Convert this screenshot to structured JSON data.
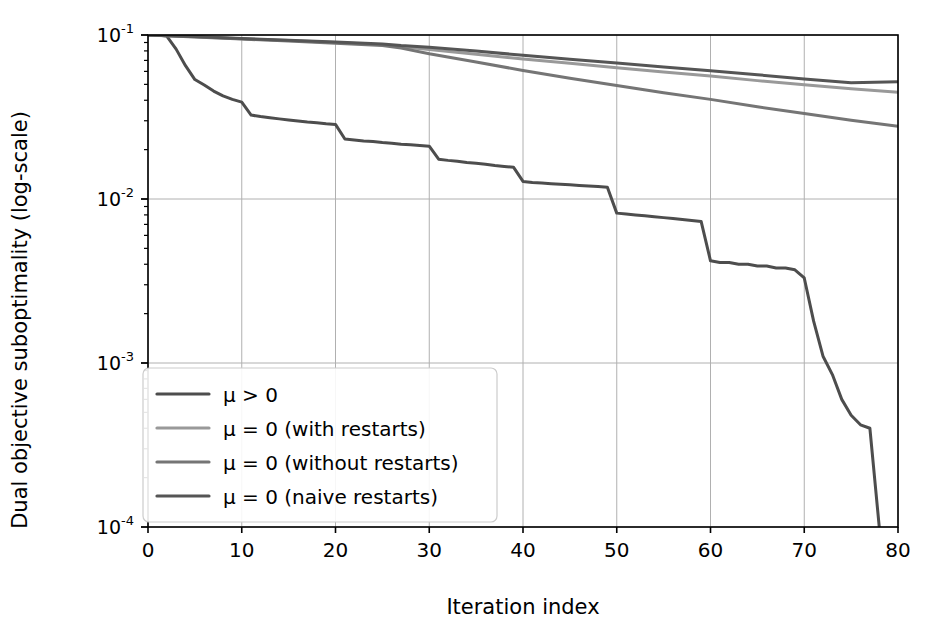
{
  "chart_data": {
    "type": "line",
    "title": "",
    "xlabel": "Iteration index",
    "ylabel": "Dual objective suboptimality (log-scale)",
    "yscale": "log",
    "xlim": [
      0,
      80
    ],
    "ylim": [
      0.0001,
      0.1
    ],
    "grid": true,
    "legend_position": "lower left",
    "xticks": [
      0,
      10,
      20,
      30,
      40,
      50,
      60,
      70,
      80
    ],
    "xticklabels": [
      "0",
      "10",
      "20",
      "30",
      "40",
      "50",
      "60",
      "70",
      "80"
    ],
    "yticks": [
      0.1,
      0.01,
      0.001,
      0.0001
    ],
    "yticklabels": [
      "10-1",
      "10-2",
      "10-3",
      "10-4"
    ],
    "ytick_mantissa": [
      "10",
      "10",
      "10",
      "10"
    ],
    "ytick_exponent": [
      "-1",
      "-2",
      "-3",
      "-4"
    ],
    "series": [
      {
        "name": "mu-greater-zero",
        "label": "μ > 0",
        "color": "#4d4d4d",
        "linewidth": 3.0,
        "x": [
          0,
          1,
          2,
          3,
          4,
          5,
          6,
          7,
          8,
          9,
          10,
          11,
          12,
          13,
          14,
          15,
          16,
          17,
          18,
          19,
          20,
          21,
          22,
          23,
          24,
          25,
          26,
          27,
          28,
          29,
          30,
          31,
          32,
          33,
          34,
          35,
          36,
          37,
          38,
          39,
          40,
          41,
          42,
          43,
          44,
          45,
          46,
          47,
          48,
          49,
          50,
          51,
          52,
          53,
          54,
          55,
          56,
          57,
          58,
          59,
          60,
          61,
          62,
          63,
          64,
          65,
          66,
          67,
          68,
          69,
          70,
          71,
          72,
          73,
          74,
          75,
          76,
          77,
          78
        ],
        "y": [
          0.1,
          0.1,
          0.0985,
          0.082,
          0.065,
          0.0535,
          0.0495,
          0.0455,
          0.0425,
          0.0405,
          0.039,
          0.0325,
          0.0318,
          0.0313,
          0.0308,
          0.0303,
          0.0299,
          0.0295,
          0.0292,
          0.0288,
          0.0285,
          0.0232,
          0.0229,
          0.0226,
          0.0224,
          0.0221,
          0.0219,
          0.0216,
          0.0214,
          0.0212,
          0.021,
          0.0175,
          0.0172,
          0.017,
          0.0167,
          0.0165,
          0.0163,
          0.016,
          0.0158,
          0.0156,
          0.0128,
          0.0126,
          0.0125,
          0.0124,
          0.0123,
          0.0122,
          0.0121,
          0.012,
          0.0119,
          0.0118,
          0.0082,
          0.0081,
          0.008,
          0.0079,
          0.0078,
          0.0077,
          0.0076,
          0.0075,
          0.0074,
          0.0073,
          0.0042,
          0.0041,
          0.0041,
          0.004,
          0.004,
          0.0039,
          0.0039,
          0.0038,
          0.0038,
          0.0037,
          0.0033,
          0.0018,
          0.0011,
          0.00085,
          0.0006,
          0.00048,
          0.00042,
          0.0004,
          0.0001
        ]
      },
      {
        "name": "mu-zero-with-restarts",
        "label": "μ = 0 (with restarts)",
        "color": "#999999",
        "linewidth": 3.0,
        "x": [
          0,
          5,
          10,
          15,
          20,
          25,
          27,
          30,
          35,
          40,
          45,
          50,
          55,
          60,
          65,
          70,
          75,
          80
        ],
        "y": [
          0.1,
          0.0975,
          0.0948,
          0.0925,
          0.09,
          0.0872,
          0.0848,
          0.0815,
          0.0762,
          0.0715,
          0.0672,
          0.0632,
          0.0595,
          0.0562,
          0.0527,
          0.0498,
          0.047,
          0.0448
        ]
      },
      {
        "name": "mu-zero-without-restarts",
        "label": "μ = 0 (without restarts)",
        "color": "#757575",
        "linewidth": 3.0,
        "x": [
          0,
          5,
          10,
          15,
          20,
          25,
          27,
          30,
          35,
          40,
          45,
          50,
          55,
          60,
          65,
          70,
          75,
          80
        ],
        "y": [
          0.1,
          0.0972,
          0.0944,
          0.0918,
          0.0892,
          0.0862,
          0.0832,
          0.0768,
          0.0684,
          0.0608,
          0.0545,
          0.0492,
          0.0445,
          0.0405,
          0.0365,
          0.0332,
          0.0302,
          0.0278
        ]
      },
      {
        "name": "mu-zero-naive-restarts",
        "label": "μ = 0 (naive restarts)",
        "color": "#555555",
        "linewidth": 3.0,
        "x": [
          0,
          5,
          10,
          15,
          20,
          25,
          27,
          30,
          35,
          40,
          45,
          50,
          55,
          60,
          65,
          70,
          75,
          80
        ],
        "y": [
          0.1,
          0.0978,
          0.0952,
          0.093,
          0.0906,
          0.0882,
          0.0862,
          0.0842,
          0.0798,
          0.0752,
          0.0712,
          0.0675,
          0.0638,
          0.0605,
          0.0572,
          0.054,
          0.0512,
          0.0518
        ]
      }
    ]
  },
  "legend": {
    "items": [
      {
        "label": "μ > 0",
        "color": "#4d4d4d"
      },
      {
        "label": "μ = 0 (with restarts)",
        "color": "#999999"
      },
      {
        "label": "μ = 0 (without restarts)",
        "color": "#757575"
      },
      {
        "label": "μ = 0 (naive restarts)",
        "color": "#555555"
      }
    ]
  },
  "axes": {
    "background": "#ffffff",
    "grid_color": "#b0b0b0",
    "frame_color": "#000000"
  }
}
